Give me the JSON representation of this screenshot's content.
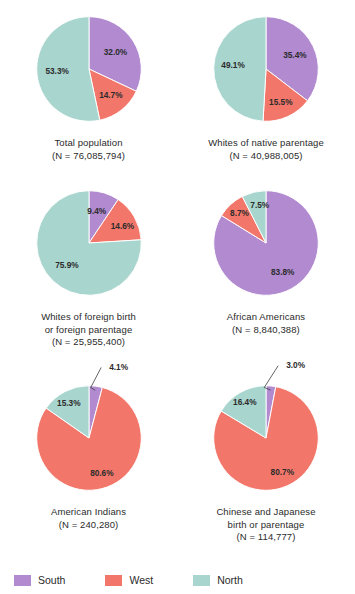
{
  "colors": {
    "south": "#b18ad0",
    "west": "#f2776a",
    "north": "#a8d5cd",
    "text": "#2b2b2b",
    "background": "#ffffff"
  },
  "legend": {
    "items": [
      {
        "label": "South",
        "color": "#b18ad0",
        "key": "south"
      },
      {
        "label": "West",
        "color": "#f2776a",
        "key": "west"
      },
      {
        "label": "North",
        "color": "#a8d5cd",
        "key": "north"
      }
    ]
  },
  "chart_data": [
    {
      "type": "pie",
      "title": "Total population",
      "subtitle": "(N = 76,085,794)",
      "n": 76085794,
      "categories": [
        "South",
        "West",
        "North"
      ],
      "values": [
        32.0,
        14.7,
        53.3
      ],
      "labels": [
        "32.0%",
        "14.7%",
        "53.3%"
      ],
      "colors": [
        "#b18ad0",
        "#f2776a",
        "#a8d5cd"
      ],
      "start_angle": 0,
      "units": "percent"
    },
    {
      "type": "pie",
      "title": "Whites of native parentage",
      "subtitle": "(N = 40,988,005)",
      "n": 40988005,
      "categories": [
        "South",
        "West",
        "North"
      ],
      "values": [
        35.4,
        15.5,
        49.1
      ],
      "labels": [
        "35.4%",
        "15.5%",
        "49.1%"
      ],
      "colors": [
        "#b18ad0",
        "#f2776a",
        "#a8d5cd"
      ],
      "start_angle": 0,
      "units": "percent"
    },
    {
      "type": "pie",
      "title": "Whites of foreign birth\nor foreign parentage",
      "subtitle": "(N = 25,955,400)",
      "n": 25955400,
      "categories": [
        "South",
        "West",
        "North"
      ],
      "values": [
        9.4,
        14.6,
        75.9
      ],
      "labels": [
        "9.4%",
        "14.6%",
        "75.9%"
      ],
      "colors": [
        "#b18ad0",
        "#f2776a",
        "#a8d5cd"
      ],
      "start_angle": 0,
      "units": "percent"
    },
    {
      "type": "pie",
      "title": "African Americans",
      "subtitle": "(N = 8,840,388)",
      "n": 8840388,
      "categories": [
        "South",
        "West",
        "North"
      ],
      "values": [
        83.8,
        8.7,
        7.5
      ],
      "labels": [
        "83.8%",
        "8.7%",
        "7.5%"
      ],
      "colors": [
        "#b18ad0",
        "#f2776a",
        "#a8d5cd"
      ],
      "start_angle": 0,
      "units": "percent"
    },
    {
      "type": "pie",
      "title": "American Indians",
      "subtitle": "(N = 240,280)",
      "n": 240280,
      "categories": [
        "South",
        "West",
        "North"
      ],
      "values": [
        4.1,
        80.6,
        15.3
      ],
      "labels": [
        "4.1%",
        "80.6%",
        "15.3%"
      ],
      "colors": [
        "#b18ad0",
        "#f2776a",
        "#a8d5cd"
      ],
      "start_angle": 0,
      "units": "percent"
    },
    {
      "type": "pie",
      "title": "Chinese and Japanese\nbirth or parentage",
      "subtitle": "(N = 114,777)",
      "n": 114777,
      "categories": [
        "South",
        "West",
        "North"
      ],
      "values": [
        3.0,
        80.7,
        16.4
      ],
      "labels": [
        "3.0%",
        "80.7%",
        "16.4%"
      ],
      "colors": [
        "#b18ad0",
        "#f2776a",
        "#a8d5cd"
      ],
      "start_angle": 0,
      "units": "percent"
    }
  ]
}
